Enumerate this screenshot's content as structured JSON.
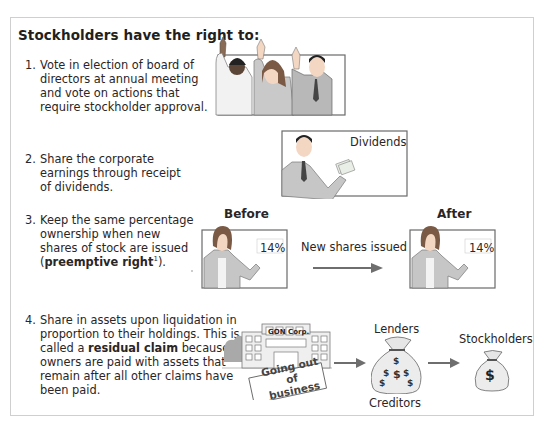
{
  "title": "Stockholders have the right to:",
  "rights": [
    {
      "number": "1.",
      "lines": [
        "Vote in election of board of",
        "directors at annual meeting",
        "and vote on actions that",
        "require stockholder approval."
      ]
    },
    {
      "number": "2.",
      "lines": [
        "Share the corporate",
        "earnings through receipt",
        "of dividends."
      ],
      "illustration_label": "Dividends"
    },
    {
      "number": "3.",
      "lines": [
        "Keep the same percentage",
        "ownership when new",
        "shares of stock are issued"
      ],
      "last_line_prefix": "(",
      "term": "preemptive right",
      "footnote": "1",
      "last_line_suffix": ").",
      "before_label": "Before",
      "after_label": "After",
      "before_percent": "14%",
      "after_percent": "14%",
      "arrow_label": "New shares issued"
    },
    {
      "number": "4.",
      "lines": [
        "Share in assets upon liquidation in",
        "proportion to their holdings. This is"
      ],
      "line3_prefix": "called a ",
      "term": "residual claim",
      "line3_suffix": " because",
      "lines_after": [
        "owners are paid with assets that",
        "remain after all other claims have",
        "been paid."
      ],
      "building_sign": "GON Corp.",
      "banner_line1": "Going out of",
      "banner_line2": "business",
      "lenders_label": "Lenders",
      "creditors_label": "Creditors",
      "stockholders_label": "Stockholders",
      "dollar_symbol": "$"
    }
  ],
  "colors": {
    "text": "#231f20",
    "frame_border": "#cfcfcf",
    "illustration_gray": "#9a9a9a",
    "arrow_gray": "#707070"
  }
}
